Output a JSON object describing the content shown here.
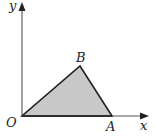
{
  "diagram": {
    "type": "coordinate-triangle",
    "axes": {
      "x_label": "x",
      "y_label": "y",
      "origin_label": "O",
      "axis_color": "#555555"
    },
    "triangle": {
      "vertices": [
        {
          "name": "O",
          "label": "O",
          "px": [
            22,
            116
          ]
        },
        {
          "name": "A",
          "label": "A",
          "px": [
            112,
            116
          ]
        },
        {
          "name": "B",
          "label": "B",
          "px": [
            80,
            66
          ]
        }
      ],
      "fill_color": "#c8c8c8",
      "stroke_color": "#222222"
    },
    "labels": {
      "vertex_A": "A",
      "vertex_B": "B"
    }
  }
}
